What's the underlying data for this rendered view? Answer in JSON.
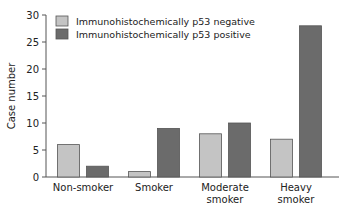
{
  "chart_data": {
    "type": "bar",
    "title": "",
    "xlabel": "",
    "ylabel": "Case number",
    "ylim": [
      0,
      30
    ],
    "yticks": [
      0,
      5,
      10,
      15,
      20,
      25,
      30
    ],
    "categories": [
      "Non-smoker",
      "Smoker",
      "Moderate smoker",
      "Heavy smoker"
    ],
    "category_lines": [
      [
        "Non-smoker"
      ],
      [
        "Smoker"
      ],
      [
        "Moderate",
        "smoker"
      ],
      [
        "Heavy",
        "smoker"
      ]
    ],
    "series": [
      {
        "name": "Immunohistochemically p53 negative",
        "color": "#c4c4c4",
        "values": [
          6,
          1,
          8,
          7
        ]
      },
      {
        "name": "Immunohistochemically p53 positive",
        "color": "#6b6b6b",
        "values": [
          2,
          9,
          10,
          28
        ]
      }
    ],
    "legend_position": "top-left",
    "grid": false
  }
}
